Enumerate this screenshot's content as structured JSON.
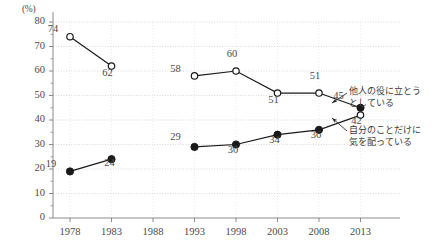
{
  "chart_data": {
    "type": "line",
    "title": "",
    "xlabel": "",
    "ylabel": "(%)",
    "unit_label": "(%)",
    "categories": [
      "1978",
      "1983",
      "1988",
      "1993",
      "1998",
      "2003",
      "2008",
      "2013"
    ],
    "ylim": [
      0,
      80
    ],
    "ytick_labels": [
      "0",
      "10",
      "20",
      "30",
      "40",
      "50",
      "60",
      "70",
      "80"
    ],
    "yticks": [
      0,
      10,
      20,
      30,
      40,
      50,
      60,
      70,
      80
    ],
    "grid": true,
    "legend": "annotations",
    "series": [
      {
        "name": "他人の役に立とうとしている",
        "marker": "open-circle",
        "end_marker": "filled-circle",
        "values": [
          74,
          62,
          null,
          58,
          60,
          51,
          51,
          45
        ],
        "labels": [
          "74",
          "62",
          "",
          "58",
          "60",
          "51",
          "51",
          "45"
        ]
      },
      {
        "name": "自分のことだけに気を配っている",
        "marker": "filled-circle",
        "end_marker": "open-circle",
        "values": [
          19,
          24,
          null,
          29,
          30,
          34,
          36,
          42
        ],
        "labels": [
          "19",
          "24",
          "",
          "29",
          "30",
          "34",
          "36",
          "42"
        ]
      }
    ],
    "annotations": [
      {
        "text_line1": "他人の役に立とう",
        "text_line2": "としている",
        "target_value": 45
      },
      {
        "text_line1": "自分のことだけに",
        "text_line2": "気を配っている",
        "target_value": 42
      }
    ],
    "colors": {
      "line": "#1a1a1a",
      "grid": "#c8c8c8",
      "axis": "#8a8a8a",
      "text": "#4a4a4a"
    }
  }
}
